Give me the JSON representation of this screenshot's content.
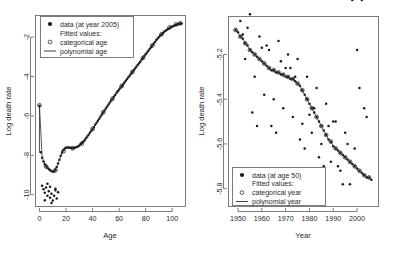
{
  "figure": {
    "title": "",
    "panels": [
      "left",
      "right"
    ]
  },
  "left_panel": {
    "ylabel": "Log death rate",
    "xlabel": "Age",
    "legend": {
      "data_label": "data (at year 2005)",
      "fitted_header": "Fitted values:",
      "categorical_label": "categorical age",
      "polynomial_label": "polynomial age"
    }
  },
  "right_panel": {
    "ylabel": "Log death rate",
    "xlabel": "Year",
    "legend": {
      "data_label": "data (at age 50)",
      "fitted_header": "Fitted values:",
      "categorical_label": "categorical year",
      "polynomial_label": "polynomial year"
    }
  },
  "chart_data": [
    {
      "type": "scatter",
      "id": "left",
      "title": "",
      "xlabel": "Age",
      "ylabel": "Log death rate",
      "xlim": [
        -3,
        110
      ],
      "ylim": [
        -10.6,
        -0.9
      ],
      "xticks": [
        0,
        20,
        40,
        60,
        80,
        100
      ],
      "yticks": [
        -2,
        -4,
        -6,
        -8,
        -10
      ],
      "grid": false,
      "legend_position": "top-left",
      "series": [
        {
          "name": "data (at year 2005)",
          "marker": "filled-circle",
          "x": [
            0,
            1,
            2,
            3,
            4,
            5,
            6,
            7,
            8,
            9,
            10,
            11,
            12,
            13,
            14,
            15,
            16,
            17,
            18,
            19,
            20,
            21,
            22,
            23,
            24,
            25,
            26,
            27,
            28,
            29,
            30,
            31,
            32,
            33,
            34,
            35,
            36,
            37,
            38,
            39,
            40,
            41,
            42,
            43,
            44,
            45,
            46,
            47,
            48,
            49,
            50,
            51,
            52,
            53,
            54,
            55,
            56,
            57,
            58,
            59,
            60,
            61,
            62,
            63,
            64,
            65,
            66,
            67,
            68,
            69,
            70,
            71,
            72,
            73,
            74,
            75,
            76,
            77,
            78,
            79,
            80,
            81,
            82,
            83,
            84,
            85,
            86,
            87,
            88,
            89,
            90,
            91,
            92,
            93,
            94,
            95,
            96,
            97,
            98,
            99,
            100,
            101,
            102,
            103,
            104,
            105,
            106,
            107
          ],
          "y": [
            -5.48,
            -7.85,
            -8.12,
            -8.32,
            -8.45,
            -8.55,
            -8.63,
            -8.7,
            -8.76,
            -8.8,
            -8.84,
            -8.82,
            -8.74,
            -8.6,
            -8.42,
            -8.22,
            -8.02,
            -7.86,
            -7.74,
            -7.66,
            -7.62,
            -7.6,
            -7.6,
            -7.62,
            -7.63,
            -7.64,
            -7.63,
            -7.61,
            -7.58,
            -7.55,
            -7.5,
            -7.44,
            -7.38,
            -7.31,
            -7.23,
            -7.14,
            -7.05,
            -6.96,
            -6.86,
            -6.76,
            -6.66,
            -6.56,
            -6.45,
            -6.35,
            -6.24,
            -6.14,
            -6.03,
            -5.93,
            -5.82,
            -5.72,
            -5.62,
            -5.52,
            -5.42,
            -5.32,
            -5.22,
            -5.13,
            -5.03,
            -4.94,
            -4.84,
            -4.75,
            -4.66,
            -4.57,
            -4.48,
            -4.39,
            -4.3,
            -4.21,
            -4.12,
            -4.03,
            -3.95,
            -3.86,
            -3.77,
            -3.68,
            -3.59,
            -3.5,
            -3.41,
            -3.32,
            -3.23,
            -3.14,
            -3.05,
            -2.96,
            -2.87,
            -2.78,
            -2.69,
            -2.6,
            -2.51,
            -2.42,
            -2.33,
            -2.24,
            -2.15,
            -2.07,
            -1.99,
            -1.92,
            -1.85,
            -1.79,
            -1.73,
            -1.68,
            -1.63,
            -1.58,
            -1.54,
            -1.5,
            -1.46,
            -1.43,
            -1.4,
            -1.37,
            -1.35,
            -1.33,
            -1.31,
            -1.3
          ]
        },
        {
          "name": "outliers-young",
          "marker": "filled-circle",
          "x": [
            2,
            3,
            4,
            5,
            6,
            7,
            8,
            9,
            10,
            11,
            12,
            13,
            14,
            6,
            9,
            12,
            4,
            8
          ],
          "y": [
            -9.55,
            -9.72,
            -9.9,
            -9.64,
            -10.05,
            -9.82,
            -10.15,
            -9.95,
            -10.3,
            -10.05,
            -9.78,
            -10.2,
            -9.88,
            -9.45,
            -10.42,
            -9.7,
            -10.28,
            -9.6
          ]
        },
        {
          "name": "categorical age (fitted)",
          "marker": "open-circle",
          "x": [
            0,
            5,
            12,
            18,
            25,
            32,
            40,
            48,
            55,
            62,
            70,
            78,
            85,
            92,
            98,
            103,
            106
          ],
          "y": [
            -5.46,
            -8.57,
            -8.76,
            -7.8,
            -7.64,
            -7.4,
            -6.66,
            -5.82,
            -5.13,
            -4.48,
            -3.77,
            -3.05,
            -2.42,
            -1.85,
            -1.5,
            -1.35,
            -1.3
          ]
        },
        {
          "name": "polynomial age (fitted line)",
          "marker": "line",
          "x": [
            0,
            2,
            5,
            8,
            11,
            14,
            17,
            20,
            23,
            26,
            30,
            35,
            40,
            45,
            50,
            55,
            60,
            65,
            70,
            75,
            80,
            85,
            90,
            95,
            100,
            104,
            107
          ],
          "y": [
            -5.48,
            -8.1,
            -8.56,
            -8.77,
            -8.82,
            -8.42,
            -7.87,
            -7.63,
            -7.62,
            -7.63,
            -7.5,
            -7.14,
            -6.66,
            -6.14,
            -5.62,
            -5.13,
            -4.66,
            -4.21,
            -3.77,
            -3.32,
            -2.87,
            -2.42,
            -1.99,
            -1.68,
            -1.46,
            -1.35,
            -1.3
          ]
        }
      ]
    },
    {
      "type": "scatter",
      "id": "right",
      "title": "",
      "xlabel": "Year",
      "ylabel": "Log death rate",
      "xlim": [
        1946,
        2009
      ],
      "ylim": [
        -5.88,
        -5.03
      ],
      "xticks": [
        1950,
        1960,
        1970,
        1980,
        1990,
        2000
      ],
      "yticks": [
        -5.2,
        -5.4,
        -5.6,
        -5.8
      ],
      "grid": false,
      "legend_position": "bottom-left",
      "series": [
        {
          "name": "data (at age 50)",
          "marker": "filled-circle",
          "x": [
            1949,
            1950,
            1951,
            1952,
            1953,
            1954,
            1955,
            1956,
            1957,
            1958,
            1959,
            1960,
            1961,
            1962,
            1963,
            1964,
            1965,
            1966,
            1967,
            1968,
            1969,
            1970,
            1971,
            1972,
            1973,
            1974,
            1975,
            1976,
            1977,
            1978,
            1979,
            1980,
            1981,
            1982,
            1983,
            1984,
            1985,
            1986,
            1987,
            1988,
            1989,
            1990,
            1991,
            1992,
            1993,
            1994,
            1995,
            1996,
            1997,
            1998,
            1999,
            2000,
            2001,
            2002,
            2003,
            2004,
            2005,
            2006,
            1951,
            1953,
            1955,
            1957,
            1959,
            1961,
            1963,
            1965,
            1967,
            1969,
            1971,
            1973,
            1975,
            1977,
            1979,
            1981,
            1983,
            1985,
            1987,
            1989,
            1991,
            1993,
            1995,
            1997,
            1999,
            2001,
            2003,
            1952,
            1956,
            1960,
            1964,
            1968,
            1972,
            1976,
            1980,
            1984,
            1988,
            1992,
            1996,
            2000,
            2004,
            1954,
            1958,
            1962,
            1966,
            1970,
            1974,
            1978,
            1982,
            1986,
            1990,
            1994,
            1998,
            2002
          ],
          "y": [
            -5.09,
            -5.1,
            -5.12,
            -5.13,
            -5.15,
            -5.16,
            -5.18,
            -5.19,
            -5.2,
            -5.21,
            -5.22,
            -5.23,
            -5.24,
            -5.25,
            -5.26,
            -5.27,
            -5.27,
            -5.28,
            -5.28,
            -5.29,
            -5.29,
            -5.3,
            -5.3,
            -5.31,
            -5.31,
            -5.32,
            -5.33,
            -5.34,
            -5.36,
            -5.38,
            -5.4,
            -5.42,
            -5.44,
            -5.46,
            -5.48,
            -5.5,
            -5.52,
            -5.54,
            -5.56,
            -5.58,
            -5.59,
            -5.61,
            -5.62,
            -5.63,
            -5.64,
            -5.65,
            -5.66,
            -5.67,
            -5.68,
            -5.69,
            -5.7,
            -5.71,
            -5.72,
            -5.73,
            -5.74,
            -5.75,
            -5.75,
            -5.76,
            -5.05,
            -5.22,
            -5.02,
            -5.3,
            -5.12,
            -5.38,
            -5.18,
            -5.4,
            -5.14,
            -5.44,
            -5.2,
            -5.48,
            -5.22,
            -5.51,
            -5.3,
            -5.55,
            -5.35,
            -5.6,
            -5.42,
            -5.68,
            -5.5,
            -5.72,
            -5.55,
            -5.78,
            -5.62,
            -5.35,
            -5.44,
            -5.11,
            -5.46,
            -5.17,
            -5.52,
            -5.23,
            -5.26,
            -5.58,
            -5.47,
            -5.66,
            -5.52,
            -5.7,
            -5.6,
            -5.18,
            -5.48,
            -5.08,
            -5.52,
            -5.16,
            -5.55,
            -5.26,
            -5.3,
            -5.62,
            -5.44,
            -5.7,
            -5.5,
            -5.78
          ]
        },
        {
          "name": "categorical year (fitted)",
          "marker": "open-circle",
          "x": [
            1949,
            1951,
            1953,
            1955,
            1957,
            1959,
            1961,
            1963,
            1965,
            1967,
            1969,
            1971,
            1973,
            1975,
            1977,
            1979,
            1981,
            1983,
            1985,
            1987,
            1989,
            1991,
            1993,
            1995,
            1997,
            1999,
            2001,
            2003,
            2005
          ],
          "y": [
            -5.09,
            -5.12,
            -5.15,
            -5.18,
            -5.2,
            -5.22,
            -5.24,
            -5.26,
            -5.27,
            -5.28,
            -5.29,
            -5.3,
            -5.31,
            -5.33,
            -5.36,
            -5.4,
            -5.44,
            -5.48,
            -5.52,
            -5.56,
            -5.59,
            -5.62,
            -5.64,
            -5.66,
            -5.68,
            -5.7,
            -5.72,
            -5.74,
            -5.75
          ]
        },
        {
          "name": "polynomial year (fitted line)",
          "marker": "line",
          "x": [
            1949,
            1952,
            1955,
            1958,
            1961,
            1964,
            1967,
            1970,
            1973,
            1976,
            1979,
            1982,
            1985,
            1988,
            1991,
            1994,
            1997,
            2000,
            2003,
            2006
          ],
          "y": [
            -5.09,
            -5.13,
            -5.18,
            -5.21,
            -5.24,
            -5.27,
            -5.28,
            -5.3,
            -5.31,
            -5.34,
            -5.4,
            -5.46,
            -5.52,
            -5.58,
            -5.62,
            -5.65,
            -5.68,
            -5.71,
            -5.74,
            -5.76
          ]
        }
      ]
    }
  ]
}
